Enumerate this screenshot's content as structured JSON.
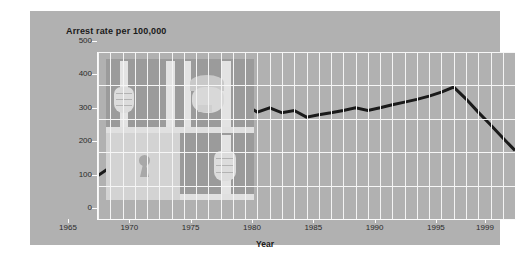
{
  "panel": {
    "bg_color": "#b1b1b1"
  },
  "title": "Arrest rate per 100,000",
  "axis_title_x": "Year",
  "illustration": {
    "name": "jail-cell-illustration"
  },
  "chart_data": {
    "type": "line",
    "title": "Arrest rate per 100,000",
    "xlabel": "Year",
    "ylabel": "",
    "xlim": [
      1965,
      1999
    ],
    "ylim": [
      0,
      500
    ],
    "ytick_labels": [
      "0",
      "100",
      "200",
      "300",
      "400",
      "500"
    ],
    "ytick_values": [
      0,
      100,
      200,
      300,
      400,
      500
    ],
    "xtick_labels": [
      "1965",
      "1970",
      "1975",
      "1980",
      "1985",
      "1990",
      "1995",
      "1999"
    ],
    "xtick_values": [
      1965,
      1970,
      1975,
      1980,
      1985,
      1990,
      1995,
      1999
    ],
    "grid": "white vertical gridlines every year, horizontal gridlines at each 100",
    "legend": "none",
    "line_color": "#1a1a1a",
    "line_width_px": 3,
    "series": [
      {
        "name": "Arrest rate per 100,000",
        "x": [
          1965,
          1966,
          1967,
          1968,
          1969,
          1970,
          1971,
          1972,
          1973,
          1974,
          1975,
          1976,
          1977,
          1978,
          1979,
          1980,
          1981,
          1982,
          1983,
          1984,
          1985,
          1986,
          1987,
          1988,
          1989,
          1990,
          1991,
          1992,
          1993,
          1994,
          1995,
          1996,
          1997,
          1998,
          1999
        ],
        "values": [
          130,
          155,
          180,
          200,
          208,
          215,
          225,
          245,
          262,
          278,
          258,
          245,
          340,
          320,
          333,
          318,
          325,
          305,
          312,
          318,
          325,
          333,
          325,
          333,
          342,
          350,
          358,
          368,
          380,
          395,
          360,
          320,
          282,
          243,
          205
        ]
      }
    ]
  }
}
